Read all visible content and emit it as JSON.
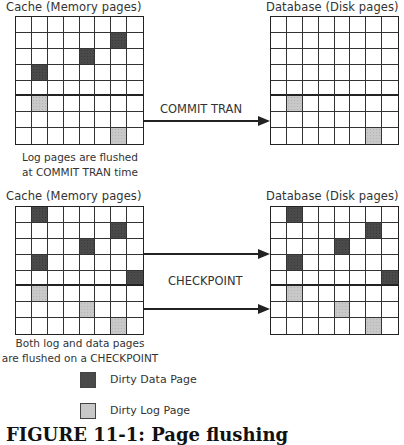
{
  "top": {
    "cache_title": "Cache (Memory pages)",
    "db_title": "Database (Disk pages)",
    "arrow_label": "COMMIT TRAN",
    "caption_line1": "Log pages are flushed",
    "caption_line2": "at COMMIT TRAN time",
    "cache_grid": {
      "rows": 8,
      "cols": 8,
      "dark": [
        [
          1,
          6
        ],
        [
          2,
          4
        ],
        [
          3,
          1
        ]
      ],
      "light": [
        [
          5,
          1
        ],
        [
          7,
          6
        ]
      ]
    },
    "db_grid": {
      "rows": 8,
      "cols": 8,
      "dark": [],
      "light": [
        [
          5,
          1
        ],
        [
          7,
          6
        ]
      ]
    }
  },
  "bottom": {
    "cache_title": "Cache (Memory pages)",
    "db_title": "Database (Disk pages)",
    "arrow_label": "CHECKPOINT",
    "caption_line1": "Both log and data pages",
    "caption_line2": "are flushed on a CHECKPOINT",
    "cache_grid": {
      "rows": 8,
      "cols": 8,
      "dark": [
        [
          0,
          1
        ],
        [
          1,
          6
        ],
        [
          2,
          4
        ],
        [
          3,
          1
        ],
        [
          4,
          7
        ]
      ],
      "light": [
        [
          5,
          1
        ],
        [
          6,
          4
        ],
        [
          7,
          6
        ]
      ]
    },
    "db_grid": {
      "rows": 8,
      "cols": 8,
      "dark": [
        [
          0,
          1
        ],
        [
          1,
          6
        ],
        [
          2,
          4
        ],
        [
          3,
          1
        ],
        [
          4,
          7
        ]
      ],
      "light": [
        [
          5,
          1
        ],
        [
          6,
          4
        ],
        [
          7,
          6
        ]
      ]
    }
  },
  "legend": {
    "dark_label": "Dirty Data Page",
    "light_label": "Dirty Log Page",
    "dark_color": "#4a4a4a",
    "light_color": "#c8c8c8"
  },
  "figure_caption": "FIGURE 11-1: Page flushing"
}
